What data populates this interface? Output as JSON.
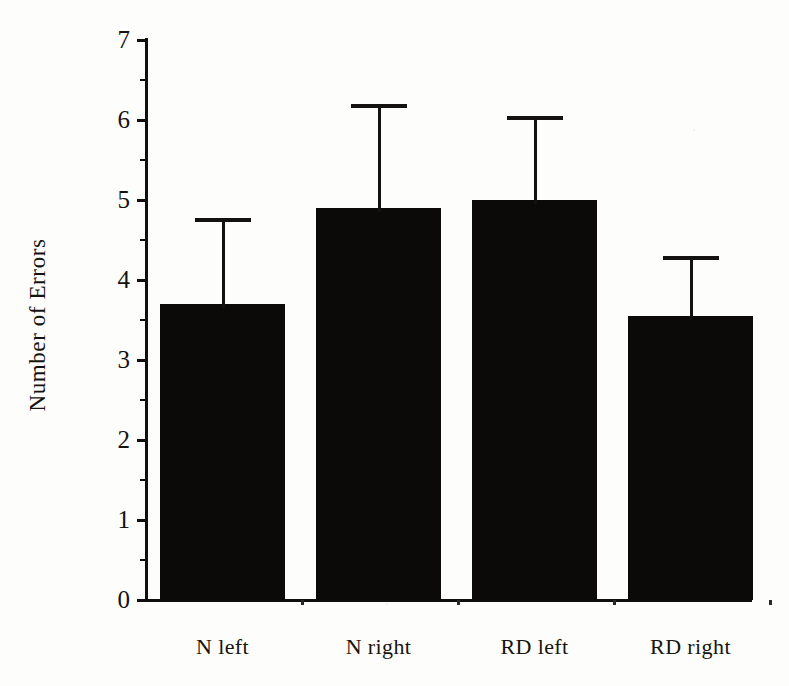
{
  "chart_data": {
    "type": "bar",
    "title": "",
    "xlabel": "",
    "ylabel": "Number of Errors",
    "categories": [
      "N left",
      "N right",
      "RD left",
      "RD right"
    ],
    "values": [
      3.7,
      4.9,
      5.0,
      3.55
    ],
    "error_upper": [
      4.78,
      6.2,
      6.05,
      4.3
    ],
    "error_bars": "upper only (T-shaped caps)",
    "ylim": [
      0,
      7
    ],
    "y_major_ticks": [
      0,
      1,
      2,
      3,
      4,
      5,
      6,
      7
    ],
    "y_minor_ticks": [
      0.5,
      1.5,
      2.5,
      3.5,
      4.5,
      5.5,
      6.5
    ],
    "y_tick_labels": [
      "0",
      "1",
      "2",
      "3",
      "4",
      "5",
      "6",
      "7"
    ],
    "grid": false,
    "legend": null,
    "bar_color": "#0b0a09",
    "axis_color": "#100f0d",
    "background_color": "#fdfdfb"
  },
  "axes": {
    "y_title": "Number of Errors",
    "y_labels": [
      "7",
      "6",
      "5",
      "4",
      "3",
      "2",
      "1",
      "0"
    ]
  },
  "series": {
    "bars": [
      {
        "label": "N left",
        "value": 3.7,
        "error_top": 4.78
      },
      {
        "label": "N right",
        "value": 4.9,
        "error_top": 6.2
      },
      {
        "label": "RD left",
        "value": 5.0,
        "error_top": 6.05
      },
      {
        "label": "RD right",
        "value": 3.55,
        "error_top": 4.3
      }
    ]
  }
}
